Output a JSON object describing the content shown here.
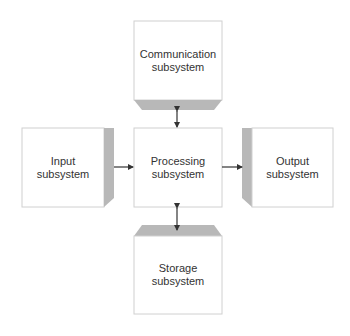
{
  "diagram": {
    "type": "block-diagram",
    "colors": {
      "box_fill": "#ffffff",
      "box_border": "#d0d0d0",
      "bevel_fill": "#b8b8b8",
      "arrow": "#333333",
      "text": "#333333"
    },
    "nodes": {
      "communication": {
        "line1": "Communication",
        "line2": "subsystem"
      },
      "input": {
        "line1": "Input",
        "line2": "subsystem"
      },
      "processing": {
        "line1": "Processing",
        "line2": "subsystem"
      },
      "output": {
        "line1": "Output",
        "line2": "subsystem"
      },
      "storage": {
        "line1": "Storage",
        "line2": "subsystem"
      }
    },
    "edges": [
      {
        "from": "communication",
        "to": "processing",
        "direction": "bidirectional"
      },
      {
        "from": "input",
        "to": "processing",
        "direction": "forward"
      },
      {
        "from": "processing",
        "to": "output",
        "direction": "forward"
      },
      {
        "from": "processing",
        "to": "storage",
        "direction": "bidirectional"
      }
    ]
  }
}
